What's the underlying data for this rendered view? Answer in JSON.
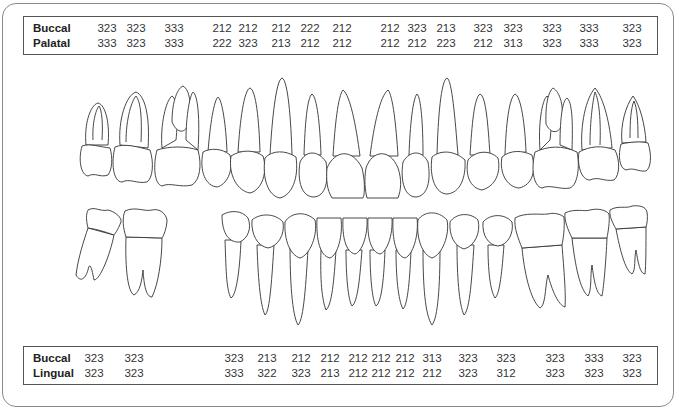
{
  "upper_table": {
    "row1_label": "Buccal",
    "row2_label": "Palatal",
    "positions": [
      107,
      136,
      174,
      222,
      248,
      281,
      310,
      342,
      390,
      417,
      446,
      483,
      513,
      552,
      589,
      632
    ],
    "row1": [
      "323",
      "323",
      "333",
      "212",
      "212",
      "212",
      "222",
      "212",
      "212",
      "323",
      "213",
      "323",
      "323",
      "323",
      "333",
      "323"
    ],
    "row2": [
      "333",
      "323",
      "333",
      "222",
      "323",
      "213",
      "212",
      "212",
      "212",
      "212",
      "223",
      "212",
      "313",
      "323",
      "333",
      "323"
    ]
  },
  "lower_table": {
    "row1_label": "Buccal",
    "row2_label": "Lingual",
    "positions": [
      94,
      134,
      234,
      267,
      301,
      330,
      358,
      381,
      405,
      432,
      468,
      506,
      555,
      594,
      632
    ],
    "row1": [
      "323",
      "323",
      "323",
      "213",
      "212",
      "212",
      "212",
      "212",
      "212",
      "313",
      "323",
      "323",
      "323",
      "333",
      "323"
    ],
    "row2": [
      "323",
      "323",
      "333",
      "322",
      "323",
      "213",
      "212",
      "212",
      "212",
      "212",
      "323",
      "312",
      "323",
      "323",
      "323"
    ]
  },
  "diagram": {
    "upper_arch": "maxillary teeth (16 teeth, molars to molars)",
    "lower_arch": "mandibular teeth (missing first premolars region gap on left)"
  },
  "colors": {
    "line": "#333333",
    "frame": "#8a8a8a",
    "background": "#ffffff"
  }
}
